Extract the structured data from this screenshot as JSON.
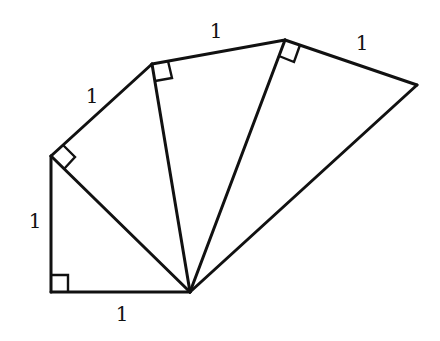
{
  "diagram": {
    "type": "spiral-of-theodorus",
    "colors": {
      "stroke": "#111111",
      "background": "#ffffff"
    },
    "vertices": {
      "O": [
        190,
        292
      ],
      "A": [
        51,
        292
      ],
      "B": [
        51,
        156
      ],
      "C": [
        152,
        64
      ],
      "D": [
        285,
        40
      ],
      "E": [
        417,
        85
      ]
    },
    "labels": [
      {
        "text": "1",
        "x": 122,
        "y": 315,
        "edge": "O-A"
      },
      {
        "text": "1",
        "x": 35,
        "y": 222,
        "edge": "A-B"
      },
      {
        "text": "1",
        "x": 92,
        "y": 97,
        "edge": "B-C"
      },
      {
        "text": "1",
        "x": 216,
        "y": 32,
        "edge": "C-D"
      },
      {
        "text": "1",
        "x": 362,
        "y": 44,
        "edge": "D-E"
      }
    ],
    "right_angles": [
      "A",
      "B",
      "C",
      "D"
    ]
  }
}
